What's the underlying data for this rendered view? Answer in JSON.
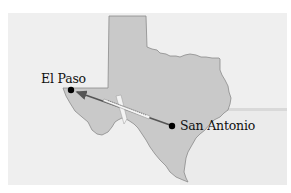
{
  "map": {
    "region": "Texas",
    "colors": {
      "background": "#efefef",
      "water": "#e9e9e9",
      "state_fill": "#c9c9c9",
      "state_border": "#8a8a8a",
      "route_line": "#555555",
      "city_dot": "#000000",
      "airplane": "#f2f2f2"
    },
    "cities": [
      {
        "name": "El Paso",
        "role": "destination"
      },
      {
        "name": "San Antonio",
        "role": "origin"
      }
    ],
    "route": {
      "from": "San Antonio",
      "to": "El Paso",
      "mode": "airplane",
      "arrow_direction": "west"
    }
  }
}
